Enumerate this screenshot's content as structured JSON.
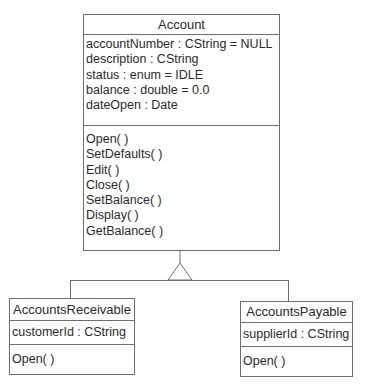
{
  "diagram": {
    "type": "UML class diagram",
    "relationship": "generalization",
    "classes": {
      "account": {
        "name": "Account",
        "attributes": [
          "accountNumber : CString = NULL",
          "description : CString",
          "status : enum = IDLE",
          "balance : double = 0.0",
          "dateOpen : Date"
        ],
        "methods": [
          "Open( )",
          "SetDefaults( )",
          "Edit( )",
          "Close( )",
          "SetBalance( )",
          "Display( )",
          "GetBalance( )"
        ]
      },
      "receivable": {
        "name": "AccountsReceivable",
        "attributes": [
          "customerId : CString"
        ],
        "methods": [
          "Open( )"
        ]
      },
      "payable": {
        "name": "AccountsPayable",
        "attributes": [
          "supplierId : CString"
        ],
        "methods": [
          "Open( )"
        ]
      }
    },
    "colors": {
      "line": "#6e6e6e",
      "text": "#2a2a2a",
      "background": "#ffffff"
    }
  }
}
